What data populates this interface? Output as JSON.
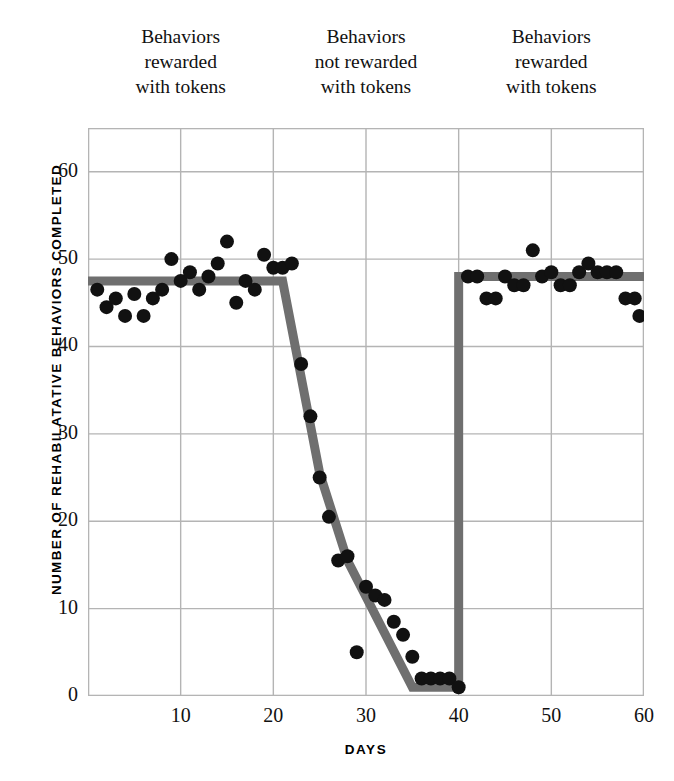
{
  "chart_data": {
    "type": "scatter",
    "title": "",
    "subtitle": "",
    "xlabel": "DAYS",
    "ylabel": "NUMBER OF REHABILATATIVE BEHAVIORS COMPLETED",
    "xlim": [
      0,
      60
    ],
    "ylim": [
      0,
      65
    ],
    "xticks": [
      10,
      20,
      30,
      40,
      50,
      60
    ],
    "yticks": [
      0,
      10,
      20,
      30,
      40,
      50,
      60
    ],
    "grid": true,
    "legend": "none",
    "marker_color": "#111111",
    "trendline_color": "#6f6f6f",
    "grid_color": "#b4b4b4",
    "phase_annotations": [
      {
        "lines": [
          "Behaviors",
          "rewarded",
          "with tokens"
        ],
        "x_range": [
          0,
          20
        ]
      },
      {
        "lines": [
          "Behaviors",
          "not rewarded",
          "with tokens"
        ],
        "x_range": [
          20,
          40
        ]
      },
      {
        "lines": [
          "Behaviors",
          "rewarded",
          "with tokens"
        ],
        "x_range": [
          40,
          60
        ]
      }
    ],
    "series": [
      {
        "name": "Rehabilatative behaviors completed",
        "points": [
          [
            1,
            46.5
          ],
          [
            2,
            44.5
          ],
          [
            3,
            45.5
          ],
          [
            4,
            43.5
          ],
          [
            5,
            46.0
          ],
          [
            6,
            43.5
          ],
          [
            7,
            45.5
          ],
          [
            8,
            46.5
          ],
          [
            9,
            50.0
          ],
          [
            10,
            47.5
          ],
          [
            11,
            48.5
          ],
          [
            12,
            46.5
          ],
          [
            13,
            48.0
          ],
          [
            14,
            49.5
          ],
          [
            15,
            52.0
          ],
          [
            16,
            45.0
          ],
          [
            17,
            47.5
          ],
          [
            18,
            46.5
          ],
          [
            19,
            50.5
          ],
          [
            20,
            49.0
          ],
          [
            21,
            49.0
          ],
          [
            22,
            49.5
          ],
          [
            23,
            38.0
          ],
          [
            24,
            32.0
          ],
          [
            25,
            25.0
          ],
          [
            26,
            20.5
          ],
          [
            27,
            15.5
          ],
          [
            28,
            16.0
          ],
          [
            29,
            5.0
          ],
          [
            30,
            12.5
          ],
          [
            31,
            11.5
          ],
          [
            32,
            11.0
          ],
          [
            33,
            8.5
          ],
          [
            34,
            7.0
          ],
          [
            35,
            4.5
          ],
          [
            36,
            2.0
          ],
          [
            37,
            2.0
          ],
          [
            38,
            2.0
          ],
          [
            39,
            2.0
          ],
          [
            40,
            1.0
          ],
          [
            41,
            48.0
          ],
          [
            42,
            48.0
          ],
          [
            43,
            45.5
          ],
          [
            44,
            45.5
          ],
          [
            45,
            48.0
          ],
          [
            46,
            47.0
          ],
          [
            47,
            47.0
          ],
          [
            48,
            51.0
          ],
          [
            49,
            48.0
          ],
          [
            50,
            48.5
          ],
          [
            51,
            47.0
          ],
          [
            52,
            47.0
          ],
          [
            53,
            48.5
          ],
          [
            54,
            49.5
          ],
          [
            55,
            48.5
          ],
          [
            56,
            48.5
          ],
          [
            57,
            48.5
          ],
          [
            58,
            45.5
          ],
          [
            59,
            45.5
          ],
          [
            59.5,
            43.5
          ]
        ]
      }
    ],
    "trendline_vertices": [
      [
        0,
        47.5
      ],
      [
        21,
        47.5
      ],
      [
        25,
        25.5
      ],
      [
        28,
        15.5
      ],
      [
        35,
        1.0
      ],
      [
        40,
        1.0
      ],
      [
        40,
        48.0
      ],
      [
        60,
        48.0
      ]
    ]
  }
}
